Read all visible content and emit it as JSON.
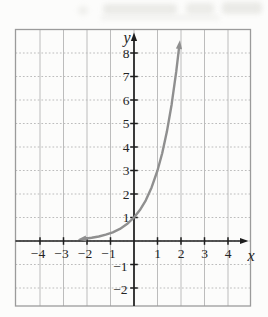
{
  "chart_data": {
    "type": "line",
    "title": "",
    "xlabel": "x",
    "ylabel": "y",
    "xlim": [
      -5,
      5
    ],
    "ylim": [
      -2.8,
      9
    ],
    "grid": true,
    "legend": "none",
    "x_axis": {
      "tick_values": [
        -4,
        -3,
        -2,
        -1,
        1,
        2,
        3,
        4
      ],
      "tick_labels": [
        "−4",
        "−3",
        "−2",
        "−1",
        "1",
        "2",
        "3",
        "4"
      ]
    },
    "y_axis": {
      "tick_values": [
        1,
        2,
        3,
        4,
        5,
        6,
        7,
        8
      ],
      "tick_labels": [
        "1",
        "2",
        "3",
        "4",
        "5",
        "6",
        "7",
        "8"
      ],
      "negative_tick_values": [
        -1,
        -2
      ],
      "negative_tick_labels": [
        "−1",
        "−2"
      ]
    },
    "series": [
      {
        "name": "exponential-curve",
        "function": "y = 3^x",
        "arrows": "both-ends",
        "x": [
          -2.1,
          -1.8,
          -1.5,
          -1.2,
          -0.9,
          -0.6,
          -0.3,
          0,
          0.25,
          0.5,
          0.75,
          1.0,
          1.2,
          1.4,
          1.6,
          1.8,
          1.92
        ],
        "y": [
          0.1,
          0.138,
          0.192,
          0.268,
          0.372,
          0.517,
          0.719,
          1.0,
          1.316,
          1.732,
          2.28,
          3.0,
          3.737,
          4.656,
          5.8,
          7.225,
          8.243
        ]
      }
    ],
    "key_points": [
      {
        "x": 0,
        "y": 1,
        "note": "y-intercept"
      }
    ],
    "colors": {
      "curve": "#8f8f8f",
      "axis": "#1e1e1e",
      "grid": "#bcbcbc",
      "border": "#9b9b9b",
      "text": "#242424",
      "background": "#fcfcfb"
    }
  }
}
